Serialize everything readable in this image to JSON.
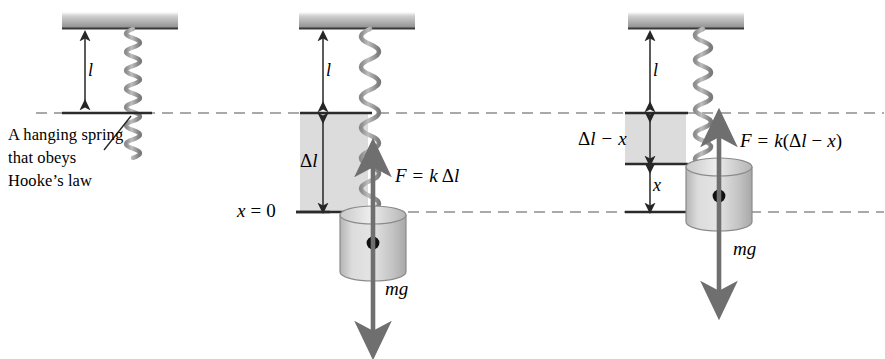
{
  "figure": {
    "type": "physics-diagram",
    "width": 885,
    "height": 359,
    "background": "#ffffff",
    "ink_color": "#2b2b2b",
    "shade_color": "#d4d4d4",
    "ceiling_color": "#b9b9b9",
    "arrow_gray": "#6f6f6f"
  },
  "caption": {
    "line1": "A hanging spring",
    "line2": "that obeys",
    "line3": "Hooke’s law"
  },
  "panel_left": {
    "name": "natural-length-spring",
    "length_label": "l",
    "description": "Spring at natural length l, no mass attached"
  },
  "panel_middle": {
    "name": "equilibrium-with-mass",
    "length_label": "l",
    "extension_label": "Δl",
    "origin_label": "x = 0",
    "spring_force_label": "F = k Δl",
    "weight_label": "mg",
    "spring_force_parts": {
      "f": "F",
      "eq": "=",
      "k": "k",
      "delta": "Δ",
      "l": "l"
    },
    "origin_parts": {
      "x": "x",
      "eq": "=",
      "zero": "0"
    }
  },
  "panel_right": {
    "name": "displaced-by-x",
    "length_label": "l",
    "extension_label": "Δl − x",
    "displacement_label": "x",
    "spring_force_label": "F = k(Δl − x)",
    "weight_label": "mg",
    "extension_parts": {
      "delta": "Δ",
      "l": "l",
      "minus": "−",
      "x": "x"
    },
    "spring_force_parts": {
      "f": "F",
      "eq": "=",
      "k": "k",
      "open": "(",
      "delta": "Δ",
      "l": "l",
      "minus": "−",
      "x": "x",
      "close": ")"
    }
  },
  "reference_lines": {
    "upper_label": "natural length reference (x = 0 level of unstretched spring end)",
    "lower_label": "equilibrium reference (x = 0)"
  }
}
